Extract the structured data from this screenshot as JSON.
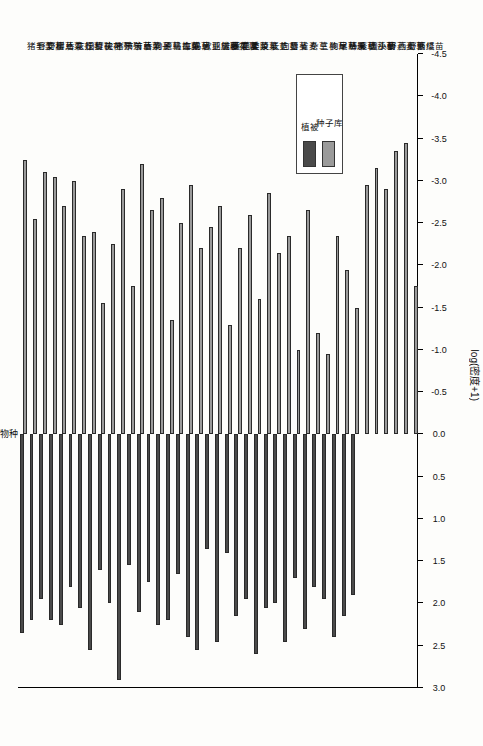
{
  "chart_data": {
    "type": "bar",
    "orientation": "horizontal-diverging",
    "title": "物种",
    "xlabel": "log(密度+1)",
    "ylabel": "物种",
    "xlim": [
      3.0,
      -4.5
    ],
    "xticks": [
      3.0,
      2.5,
      2.0,
      1.5,
      1.0,
      0.5,
      0.0,
      -0.5,
      -1.0,
      -1.5,
      -2.0,
      -2.5,
      -3.0,
      -3.5,
      -4.0,
      -4.5
    ],
    "xticklabels": [
      "3.0",
      "2.5",
      "2.0",
      "1.5",
      "1.0",
      "0.5",
      "0.0",
      "-0.5",
      "-1.0",
      "-1.5",
      "-2.0",
      "-2.5",
      "-3.0",
      "-3.5",
      "-4.0",
      "-4.5"
    ],
    "grid": false,
    "legend_position": "top-left",
    "series": [
      {
        "name": "植被",
        "color": "#4a4a4a",
        "sign": "positive"
      },
      {
        "name": "种子库",
        "color": "#9a9a9a",
        "sign": "negative"
      }
    ],
    "categories": [
      "猪毛菜",
      "野艾蒿",
      "野樱草",
      "树儿菜",
      "香花芥",
      "灰绿藜",
      "田旋花",
      "打碗花",
      "尖叶蓼",
      "猪殃殃",
      "节节草",
      "苦苣菜",
      "香附子",
      "狗尾草",
      "原拉拉藤",
      "马齿苋",
      "车前草",
      "马唐",
      "欧亚旋覆花",
      "鹅绒藤",
      "苦苣菜属",
      "黄花蒿",
      "苣荬菜",
      "委陵菜",
      "反枝苋",
      "长芒苋",
      "向日葵",
      "藜",
      "雀麦",
      "杂草",
      "三棱草",
      "狗尾草属",
      "早熟禾",
      "棒头草",
      "紧穗莎草",
      "圆头藜",
      "小蓟",
      "野燕麦",
      "西瓜草",
      "野西瓜苗",
      "繁缕"
    ],
    "values_vegetation": [
      2.35,
      2.2,
      1.95,
      2.2,
      2.25,
      1.8,
      2.05,
      2.55,
      1.6,
      2.0,
      2.9,
      1.55,
      2.1,
      1.75,
      2.25,
      2.2,
      1.65,
      2.4,
      2.55,
      1.35,
      2.45,
      1.4,
      2.15,
      1.95,
      2.6,
      2.05,
      2.0,
      2.45,
      1.7,
      2.3,
      1.8,
      1.95,
      2.4,
      2.15,
      1.9,
      0.0,
      0.0,
      0.0,
      0.0,
      0.0,
      0.0
    ],
    "values_seedbank": [
      -3.25,
      -2.55,
      -3.1,
      -3.05,
      -2.7,
      -3.0,
      -2.35,
      -2.4,
      -1.55,
      -2.25,
      -2.9,
      -1.75,
      -3.2,
      -2.65,
      -2.8,
      -1.35,
      -2.5,
      -2.95,
      -2.2,
      -2.45,
      -2.7,
      -1.3,
      -2.2,
      -2.6,
      -1.6,
      -2.85,
      -2.15,
      -2.35,
      -1.0,
      -2.65,
      -1.2,
      -0.95,
      -2.35,
      -1.95,
      -1.5,
      -2.95,
      -3.15,
      -2.9,
      -3.35,
      -3.45,
      -1.75
    ]
  },
  "legend": {
    "items": [
      {
        "label": "植被",
        "color": "#4a4a4a"
      },
      {
        "label": "种子库",
        "color": "#9a9a9a"
      }
    ]
  },
  "axis": {
    "title": "log(密度+1)",
    "top_title": "物种"
  }
}
